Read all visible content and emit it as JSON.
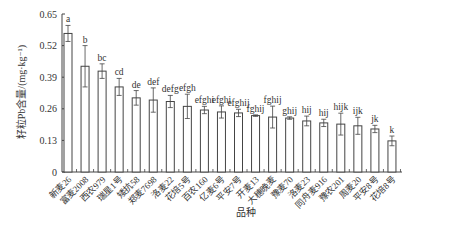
{
  "chart_data": {
    "type": "bar",
    "title": "",
    "xlabel": "品种",
    "ylabel": "籽粒Pb含量/(mg·kg⁻¹)",
    "ylim": [
      0,
      0.65
    ],
    "yticks": [
      "0",
      "0.13",
      "0.26",
      "0.39",
      "0.52",
      "0.65"
    ],
    "grid": false,
    "legend": null,
    "categories": [
      "新麦26",
      "富麦2008",
      "西农979",
      "瑞星1号",
      "矮抗58",
      "郑麦7698",
      "洛麦22",
      "花培5号",
      "百农160",
      "亿麦6号",
      "平安7号",
      "开麦13",
      "大穗晚麦",
      "豫麦70",
      "洛麦23",
      "同舟麦916",
      "豫农201",
      "周麦20",
      "平安8号",
      "花培8号"
    ],
    "values": [
      0.57,
      0.435,
      0.415,
      0.35,
      0.305,
      0.296,
      0.29,
      0.27,
      0.255,
      0.247,
      0.243,
      0.232,
      0.226,
      0.222,
      0.21,
      0.202,
      0.197,
      0.19,
      0.177,
      0.128
    ],
    "errors": [
      0.033,
      0.085,
      0.03,
      0.035,
      0.03,
      0.05,
      0.025,
      0.05,
      0.015,
      0.025,
      0.015,
      0.003,
      0.045,
      0.005,
      0.02,
      0.015,
      0.045,
      0.035,
      0.015,
      0.02
    ],
    "significance_letters": [
      "a",
      "b",
      "bc",
      "cd",
      "de",
      "def",
      "defg",
      "efgh",
      "efghi",
      "efghi",
      "efghij",
      "fghij",
      "fghij",
      "ghij",
      "hij",
      "hij",
      "hijk",
      "ijk",
      "jk",
      "k"
    ]
  }
}
